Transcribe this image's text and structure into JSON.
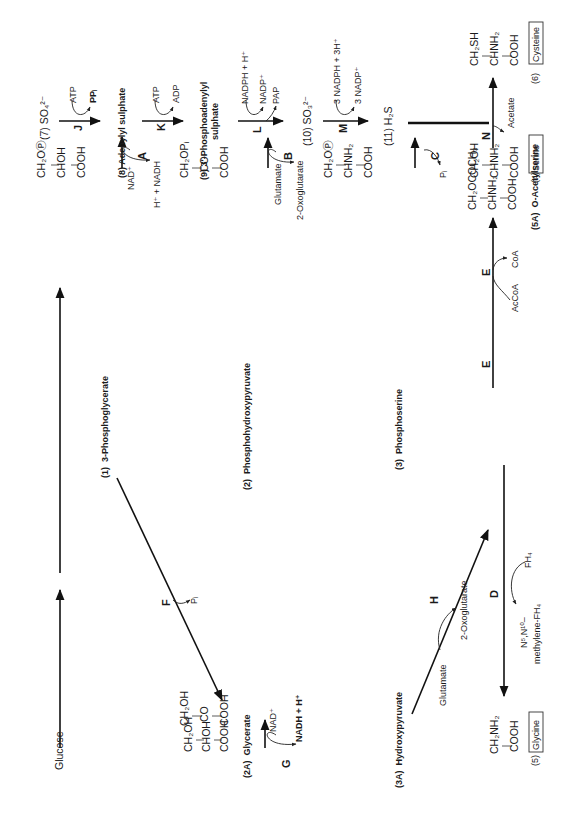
{
  "figure": {
    "orientation": "rotated-90-ccw",
    "compounds": {
      "glucose": {
        "label": "Glucose"
      },
      "c1": {
        "number": "(1)",
        "name": "3-Phosphoglycerate",
        "formula": [
          "CH₂OⓅ",
          "CHOH",
          "COOH"
        ]
      },
      "c2": {
        "number": "(2)",
        "name": "Phosphohydroxypyruvate",
        "formula": [
          "CH₂OPᵢ",
          "CO",
          "COOH"
        ]
      },
      "c2a": {
        "number": "(2A)",
        "name": "Glycerate",
        "formula": [
          "CH₂OH",
          "CHOH",
          "COOH"
        ]
      },
      "c3": {
        "number": "(3)",
        "name": "Phosphoserine",
        "formula": [
          "CH₂OⓅ",
          "CHNH₂",
          "COOH"
        ]
      },
      "c3a": {
        "number": "(3A)",
        "name": "Hydroxypyruvate",
        "formula": [
          "CH₂OH",
          "CO",
          "COOH"
        ]
      },
      "c4": {
        "number": "(4)",
        "name": "Serine",
        "formula": [
          "CH₂OH",
          "CHNH₂",
          "COOH"
        ]
      },
      "c5": {
        "number": "(5)",
        "name": "Glycine",
        "formula": [
          "CH₂NH₂",
          "COOH"
        ]
      },
      "c5a": {
        "number": "(5A)",
        "name": "O-Acetylserine",
        "formula": [
          "CH₂OCOCH₃",
          "CHNH₂",
          "COOH"
        ]
      },
      "c6": {
        "number": "(6)",
        "name": "Cysteine",
        "formula": [
          "CH₂SH",
          "CHNH₂",
          "COOH"
        ]
      },
      "c7": {
        "label": "(7) SO₄²⁻"
      },
      "c8": {
        "label": "(8)  Adenylyl sulphate"
      },
      "c9": {
        "label": "(9)  3′-Phosphoadenylyl",
        "label2": "sulphate"
      },
      "c10": {
        "label": "(10) SO₃²⁻"
      },
      "c11": {
        "label": "(11) H₂S"
      }
    },
    "enzymes": {
      "A": "A",
      "B": "B",
      "C": "C",
      "D": "D",
      "E": "E",
      "F": "F",
      "G": "G",
      "H": "H",
      "J": "J",
      "K": "K",
      "L": "L",
      "M": "M",
      "N": "N"
    },
    "cofactors": {
      "A_in": "NAD⁺",
      "A_out": "H⁺ + NADH",
      "B_in": "Glutamate",
      "B_out": "2-Oxoglutarate",
      "C_out": "Pᵢ",
      "D_in": "FH₄",
      "D_out1": "N⁵,N¹⁰–",
      "D_out2": "methylene-FH₄",
      "E_in": "AcCoA",
      "E_out": "CoA",
      "F_out": "Pᵢ",
      "G_in": "NAD⁺",
      "G_out": "NADH + H⁺",
      "H_in": "Glutamate",
      "H_out": "2-Oxoglutarate",
      "J_in": "ATP",
      "J_out": "PPᵢ",
      "K_in": "ATP",
      "K_out": "ADP",
      "L_in": "NADPH + H⁺",
      "L_out1": "NADP⁺",
      "L_out2": "PAP",
      "M_in": "3 NADPH + 3H⁺",
      "M_out": "3 NADP⁺",
      "N_out": "Acetate"
    }
  }
}
